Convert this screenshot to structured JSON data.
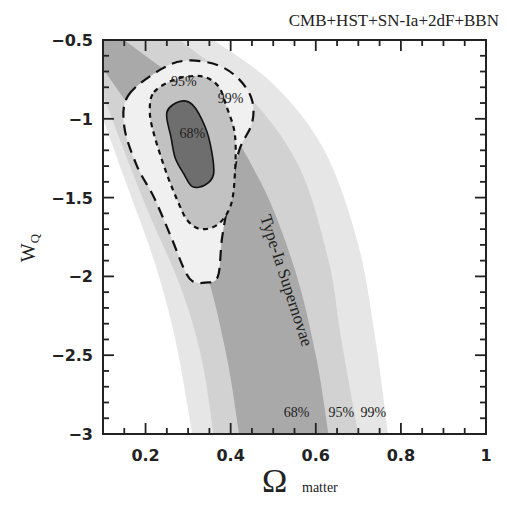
{
  "chart_data": {
    "type": "contour",
    "title": "CMB+HST+SN-Ia+2dF+BBN",
    "xlabel": "Ω matter",
    "xlabel_symbol": "Ω",
    "xlabel_subscript": "matter",
    "ylabel": "WQ",
    "ylabel_main": "W",
    "ylabel_subscript": "Q",
    "xlim": [
      0.1,
      1.0
    ],
    "ylim": [
      -3.0,
      -0.5
    ],
    "x_ticks": [
      0.2,
      0.4,
      0.6,
      0.8,
      1.0
    ],
    "x_tick_labels": [
      "0.2",
      "0.4",
      "0.6",
      "0.8",
      "1"
    ],
    "y_ticks": [
      -0.5,
      -1.0,
      -1.5,
      -2.0,
      -2.5,
      -3.0
    ],
    "y_tick_labels": [
      "-0.5",
      "-1",
      "-1.5",
      "-2",
      "-2.5",
      "-3"
    ],
    "grid": false,
    "legend": null,
    "supernova_bands": {
      "label": "Type-Ia Supernovae",
      "levels": [
        {
          "name": "99%",
          "fill": "#e6e6e6",
          "left_edge": [
            [
              0.1,
              -1.0
            ],
            [
              0.16,
              -1.45
            ],
            [
              0.22,
              -1.9
            ],
            [
              0.27,
              -2.4
            ],
            [
              0.31,
              -3.0
            ]
          ],
          "right_edge": [
            [
              0.36,
              -0.5
            ],
            [
              0.5,
              -0.78
            ],
            [
              0.62,
              -1.2
            ],
            [
              0.7,
              -1.8
            ],
            [
              0.74,
              -2.4
            ],
            [
              0.77,
              -3.0
            ]
          ]
        },
        {
          "name": "95%",
          "fill": "#d2d2d2",
          "left_edge": [
            [
              0.1,
              -0.85
            ],
            [
              0.2,
              -1.55
            ],
            [
              0.28,
              -2.05
            ],
            [
              0.33,
              -2.5
            ],
            [
              0.36,
              -3.0
            ]
          ],
          "right_edge": [
            [
              0.28,
              -0.5
            ],
            [
              0.44,
              -0.85
            ],
            [
              0.56,
              -1.3
            ],
            [
              0.63,
              -1.9
            ],
            [
              0.66,
              -2.4
            ],
            [
              0.7,
              -3.0
            ]
          ]
        },
        {
          "name": "68%",
          "fill": "#a9a9a9",
          "left_edge": [
            [
              0.1,
              -0.68
            ],
            [
              0.25,
              -1.3
            ],
            [
              0.34,
              -1.95
            ],
            [
              0.39,
              -2.5
            ],
            [
              0.42,
              -3.0
            ]
          ],
          "right_edge": [
            [
              0.15,
              -0.5
            ],
            [
              0.36,
              -0.95
            ],
            [
              0.47,
              -1.4
            ],
            [
              0.55,
              -1.95
            ],
            [
              0.6,
              -2.5
            ],
            [
              0.63,
              -3.0
            ]
          ]
        }
      ],
      "level_labels": [
        {
          "text": "68%",
          "x": 0.555,
          "y": -2.89
        },
        {
          "text": "95%",
          "x": 0.66,
          "y": -2.89
        },
        {
          "text": "99%",
          "x": 0.735,
          "y": -2.89
        }
      ]
    },
    "combined_contours": {
      "levels": [
        {
          "name": "99%",
          "style": "long-dashed",
          "fill": "#f0f0f0",
          "points": [
            [
              0.16,
              -0.85
            ],
            [
              0.24,
              -0.68
            ],
            [
              0.3,
              -0.63
            ],
            [
              0.37,
              -0.66
            ],
            [
              0.42,
              -0.75
            ],
            [
              0.45,
              -0.88
            ],
            [
              0.45,
              -1.03
            ],
            [
              0.42,
              -1.2
            ],
            [
              0.4,
              -1.45
            ],
            [
              0.38,
              -1.75
            ],
            [
              0.37,
              -2.0
            ],
            [
              0.34,
              -2.04
            ],
            [
              0.31,
              -2.03
            ],
            [
              0.29,
              -1.95
            ],
            [
              0.26,
              -1.75
            ],
            [
              0.22,
              -1.5
            ],
            [
              0.18,
              -1.3
            ],
            [
              0.15,
              -1.05
            ]
          ]
        },
        {
          "name": "95%",
          "style": "short-dashed",
          "fill": "#c2c2c2",
          "points": [
            [
              0.22,
              -0.83
            ],
            [
              0.27,
              -0.75
            ],
            [
              0.33,
              -0.73
            ],
            [
              0.37,
              -0.79
            ],
            [
              0.39,
              -0.92
            ],
            [
              0.41,
              -1.1
            ],
            [
              0.41,
              -1.35
            ],
            [
              0.4,
              -1.55
            ],
            [
              0.37,
              -1.67
            ],
            [
              0.33,
              -1.7
            ],
            [
              0.3,
              -1.65
            ],
            [
              0.28,
              -1.55
            ],
            [
              0.25,
              -1.35
            ],
            [
              0.22,
              -1.1
            ],
            [
              0.21,
              -0.95
            ]
          ]
        },
        {
          "name": "68%",
          "style": "solid",
          "fill": "#6e6e6e",
          "points": [
            [
              0.25,
              -0.96
            ],
            [
              0.28,
              -0.89
            ],
            [
              0.31,
              -0.91
            ],
            [
              0.34,
              -1.05
            ],
            [
              0.355,
              -1.2
            ],
            [
              0.36,
              -1.35
            ],
            [
              0.34,
              -1.42
            ],
            [
              0.31,
              -1.43
            ],
            [
              0.29,
              -1.35
            ],
            [
              0.27,
              -1.25
            ],
            [
              0.26,
              -1.12
            ]
          ]
        }
      ],
      "level_labels": [
        {
          "text": "95%",
          "x": 0.29,
          "y": -0.79
        },
        {
          "text": "99%",
          "x": 0.4,
          "y": -0.9
        },
        {
          "text": "68%",
          "x": 0.31,
          "y": -1.12
        }
      ]
    }
  }
}
